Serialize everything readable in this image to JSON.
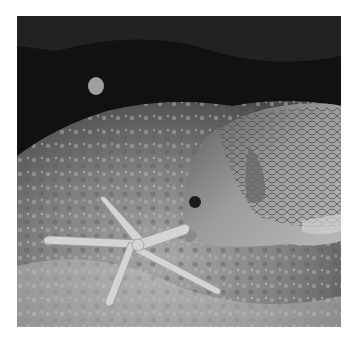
{
  "image": {
    "subject": "Fish nudging a starfish on a rocky reef",
    "style": "grayscale photograph",
    "elements": [
      "fish",
      "starfish",
      "rock",
      "dark cave background"
    ],
    "colors": {
      "border": "#ffffff",
      "background_dark": "#0e0e0e",
      "rock": "#8a8a8a",
      "fish": "#9a9a9a",
      "starfish": "#d6d6d6"
    }
  }
}
